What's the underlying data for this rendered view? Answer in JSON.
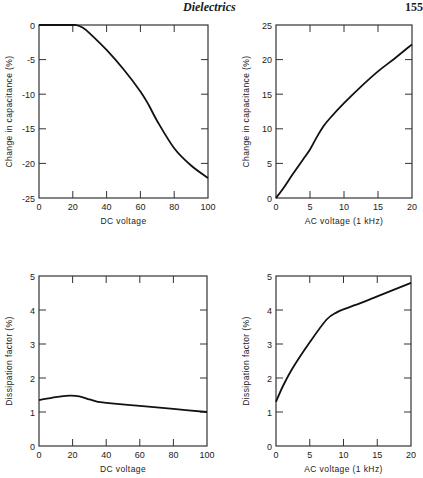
{
  "header": {
    "title": "Dielectrics",
    "page_number": "155"
  },
  "chart_data": [
    {
      "id": "dc-capacitance",
      "type": "line",
      "title": "",
      "xlabel": "DC voltage",
      "ylabel": "Change in capacitance (%)",
      "xlim": [
        0,
        100
      ],
      "ylim": [
        -25,
        0
      ],
      "xticks": [
        0,
        20,
        40,
        60,
        80,
        100
      ],
      "yticks": [
        0,
        -5,
        -10,
        -15,
        -20,
        -25
      ],
      "grid": false,
      "box": {
        "left": 39,
        "top": 25,
        "right": 208,
        "bottom": 198
      },
      "x": [
        0,
        10,
        20,
        22,
        26,
        30,
        40,
        50,
        60,
        65,
        70,
        80,
        90,
        100
      ],
      "y": [
        0,
        0,
        0,
        0,
        -0.4,
        -1.2,
        -3.6,
        -6.4,
        -9.6,
        -11.6,
        -13.9,
        -17.8,
        -20.3,
        -22.1
      ]
    },
    {
      "id": "ac-capacitance",
      "type": "line",
      "title": "",
      "xlabel": "AC voltage (1 kHz)",
      "ylabel": "Change in capacitance (%)",
      "xlim": [
        0,
        20
      ],
      "ylim": [
        0,
        25
      ],
      "xticks": [
        0,
        5,
        10,
        15,
        20
      ],
      "yticks": [
        0,
        5,
        10,
        15,
        20,
        25
      ],
      "grid": false,
      "box": {
        "left": 276,
        "top": 25,
        "right": 412,
        "bottom": 198
      },
      "x": [
        0,
        1,
        2.5,
        4,
        5,
        6,
        7,
        8,
        10,
        12.5,
        15,
        17.5,
        20
      ],
      "y": [
        0,
        1.3,
        3.5,
        5.6,
        7.0,
        8.8,
        10.4,
        11.6,
        13.7,
        16.1,
        18.3,
        20.2,
        22.2
      ]
    },
    {
      "id": "dc-dissipation",
      "type": "line",
      "title": "",
      "xlabel": "DC voltage",
      "ylabel": "Dissipation factor (%)",
      "xlim": [
        0,
        100
      ],
      "ylim": [
        0,
        5
      ],
      "xticks": [
        0,
        20,
        40,
        60,
        80,
        100
      ],
      "yticks": [
        0,
        1,
        2,
        3,
        4,
        5
      ],
      "grid": false,
      "box": {
        "left": 39,
        "top": 276,
        "right": 207,
        "bottom": 446
      },
      "x": [
        0,
        10,
        18,
        24,
        30,
        35,
        40,
        60,
        80,
        100
      ],
      "y": [
        1.35,
        1.44,
        1.48,
        1.46,
        1.37,
        1.3,
        1.27,
        1.18,
        1.09,
        1.0
      ]
    },
    {
      "id": "ac-dissipation",
      "type": "line",
      "title": "",
      "xlabel": "AC voltage (1 kHz)",
      "ylabel": "Dissipation factor (%)",
      "xlim": [
        0,
        20
      ],
      "ylim": [
        0,
        5
      ],
      "xticks": [
        0,
        5,
        10,
        15,
        20
      ],
      "yticks": [
        0,
        1,
        2,
        3,
        4,
        5
      ],
      "grid": false,
      "box": {
        "left": 276,
        "top": 276,
        "right": 411,
        "bottom": 446
      },
      "x": [
        0,
        1,
        2.5,
        5,
        7.5,
        9,
        10,
        12.5,
        15,
        17.5,
        20
      ],
      "y": [
        1.3,
        1.75,
        2.3,
        3.05,
        3.72,
        3.93,
        4.02,
        4.2,
        4.4,
        4.6,
        4.8
      ]
    }
  ]
}
